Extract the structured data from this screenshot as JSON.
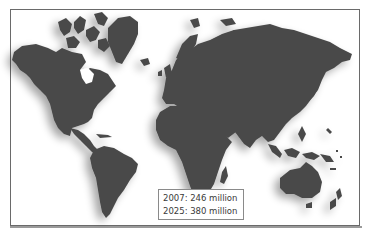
{
  "map": {
    "type": "world-map",
    "land_color": "#4a4a4a",
    "background_color": "#ffffff",
    "shadow_color": "#c8c8c8",
    "frame_color": "#6a6a6a"
  },
  "legend": {
    "entries": [
      {
        "year": "2007",
        "value": "246 million",
        "label": "2007: 246 million"
      },
      {
        "year": "2025",
        "value": "380 million",
        "label": "2025: 380 million"
      }
    ]
  }
}
